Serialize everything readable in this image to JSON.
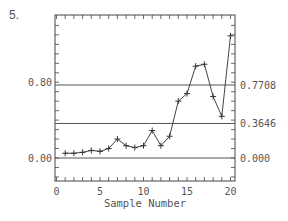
{
  "figure": {
    "number_label": "5."
  },
  "chart_data": {
    "type": "line",
    "title": "",
    "xlabel": "Sample Number",
    "ylabel": "",
    "x": [
      1,
      2,
      3,
      4,
      5,
      6,
      7,
      8,
      9,
      10,
      11,
      12,
      13,
      14,
      15,
      16,
      17,
      18,
      19,
      20
    ],
    "series": [
      {
        "name": "samples",
        "marker": "+",
        "values": [
          0.05,
          0.05,
          0.06,
          0.08,
          0.07,
          0.1,
          0.2,
          0.13,
          0.11,
          0.13,
          0.29,
          0.13,
          0.23,
          0.6,
          0.68,
          0.97,
          0.99,
          0.65,
          0.44,
          1.29
        ]
      }
    ],
    "xlim": [
      0,
      20
    ],
    "ylim": [
      -0.24,
      1.51
    ],
    "x_ticks": [
      "0",
      "5",
      "10",
      "15",
      "20"
    ],
    "left_y_labels": [
      {
        "value": 0.8,
        "label": "0.80"
      },
      {
        "value": 0.0,
        "label": "0.00"
      }
    ],
    "reference_lines": [
      {
        "value": 0.7708,
        "label": "0.7708",
        "role": "upper control limit"
      },
      {
        "value": 0.3646,
        "label": "0.3646",
        "role": "center line"
      },
      {
        "value": 0.0,
        "label": "0.000",
        "role": "lower control limit"
      }
    ],
    "grid": false,
    "legend": "none"
  }
}
